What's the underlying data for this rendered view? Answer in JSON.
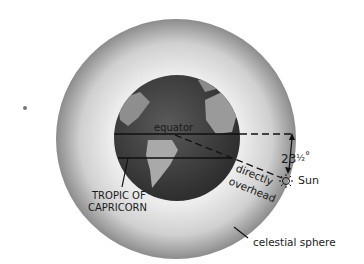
{
  "labels": {
    "equator": "equator",
    "angle": "23½°",
    "angle_main": "23",
    "angle_frac": "½",
    "angle_deg": "°",
    "sun": "Sun",
    "directly": "directly",
    "overhead": "overhead",
    "tropic_line1": "TROPIC OF",
    "tropic_line2": "CAPRICORN",
    "celestial_sphere": "celestial sphere"
  },
  "colors": {
    "sphere_edge": "#8a8a8a",
    "sphere_inner": "#f0f0f0",
    "globe_ocean": "#4a4a4a",
    "globe_land": "#a8a8a8",
    "line": "#111111"
  }
}
